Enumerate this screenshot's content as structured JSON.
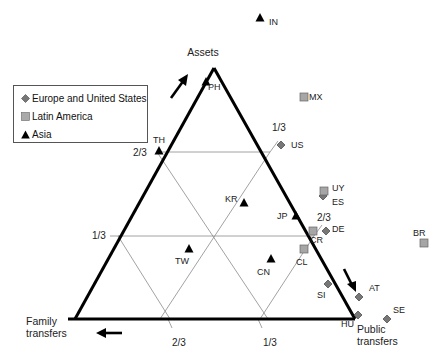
{
  "chart_data": {
    "type": "ternary-scatter",
    "title": "",
    "vertices": {
      "top": "Assets",
      "bottom_left": "Family transfers",
      "bottom_right": "Public transfers"
    },
    "ticks": {
      "left_edge": [
        "2/3",
        "1/3"
      ],
      "right_edge": [
        "1/3",
        "2/3"
      ],
      "bottom_edge": [
        "2/3",
        "1/3"
      ]
    },
    "legend": [
      {
        "label": "Europe and United States",
        "marker": "diamond",
        "color": "#777777"
      },
      {
        "label": "Latin America",
        "marker": "square",
        "color": "#999999"
      },
      {
        "label": "Asia",
        "marker": "triangle",
        "color": "#000000"
      }
    ],
    "series": [
      {
        "name": "Europe and United States",
        "marker": "diamond",
        "points": [
          {
            "label": "US",
            "x": 281,
            "y": 145
          },
          {
            "label": "ES",
            "x": 323,
            "y": 196
          },
          {
            "label": "DE",
            "x": 326,
            "y": 231
          },
          {
            "label": "SI",
            "x": 328,
            "y": 284
          },
          {
            "label": "AT",
            "x": 359,
            "y": 297
          },
          {
            "label": "HU",
            "x": 358,
            "y": 315
          },
          {
            "label": "SE",
            "x": 387,
            "y": 319
          }
        ]
      },
      {
        "name": "Latin America",
        "marker": "square",
        "points": [
          {
            "label": "MX",
            "x": 304,
            "y": 97
          },
          {
            "label": "UY",
            "x": 324,
            "y": 191
          },
          {
            "label": "CR",
            "x": 313,
            "y": 231
          },
          {
            "label": "CL",
            "x": 304,
            "y": 249
          },
          {
            "label": "BR",
            "x": 424,
            "y": 243
          }
        ]
      },
      {
        "name": "Asia",
        "marker": "triangle",
        "points": [
          {
            "label": "IN",
            "x": 260,
            "y": 18
          },
          {
            "label": "PH",
            "x": 206,
            "y": 82
          },
          {
            "label": "TH",
            "x": 159,
            "y": 151
          },
          {
            "label": "KR",
            "x": 244,
            "y": 203
          },
          {
            "label": "JP",
            "x": 296,
            "y": 216
          },
          {
            "label": "TW",
            "x": 189,
            "y": 249
          },
          {
            "label": "CN",
            "x": 271,
            "y": 259
          }
        ]
      }
    ],
    "grid": true,
    "legend_position": "upper-left"
  }
}
